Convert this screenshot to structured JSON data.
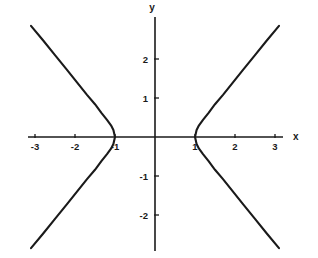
{
  "chart_data": {
    "type": "line",
    "title": "",
    "subtitle": "",
    "xlabel": "x",
    "ylabel": "y",
    "xlim": [
      -3.2,
      3.2
    ],
    "ylim": [
      -3.0,
      3.0
    ],
    "grid": false,
    "legend": null,
    "axis_color": "#1a1a1a",
    "curve_color": "#1a1a1a",
    "background": "#ffffff",
    "x_ticks": [
      {
        "value": -3,
        "label": "-3"
      },
      {
        "value": -2,
        "label": "-2"
      },
      {
        "value": -1,
        "label": "-1"
      },
      {
        "value": 1,
        "label": "1"
      },
      {
        "value": 2,
        "label": "2"
      },
      {
        "value": 3,
        "label": "3"
      }
    ],
    "y_ticks": [
      {
        "value": 2,
        "label": "2"
      },
      {
        "value": 1,
        "label": "1"
      },
      {
        "value": -1,
        "label": "-1"
      },
      {
        "value": -2,
        "label": "-2"
      }
    ],
    "series": [
      {
        "name": "right-branch",
        "description": "Hyperbola right branch, vertex at (1, 0)",
        "points": [
          [
            3.1,
            2.85
          ],
          [
            2.8,
            2.48
          ],
          [
            2.5,
            2.1
          ],
          [
            2.2,
            1.72
          ],
          [
            1.95,
            1.4
          ],
          [
            1.7,
            1.08
          ],
          [
            1.5,
            0.84
          ],
          [
            1.34,
            0.62
          ],
          [
            1.2,
            0.44
          ],
          [
            1.1,
            0.3
          ],
          [
            1.04,
            0.18
          ],
          [
            1.0,
            0.0
          ],
          [
            1.04,
            -0.18
          ],
          [
            1.1,
            -0.3
          ],
          [
            1.2,
            -0.44
          ],
          [
            1.34,
            -0.62
          ],
          [
            1.5,
            -0.84
          ],
          [
            1.7,
            -1.08
          ],
          [
            1.95,
            -1.4
          ],
          [
            2.2,
            -1.72
          ],
          [
            2.5,
            -2.1
          ],
          [
            2.8,
            -2.48
          ],
          [
            3.1,
            -2.85
          ]
        ]
      },
      {
        "name": "left-branch",
        "description": "Hyperbola left branch, vertex at (-1, 0)",
        "points": [
          [
            -3.1,
            2.85
          ],
          [
            -2.8,
            2.48
          ],
          [
            -2.5,
            2.1
          ],
          [
            -2.2,
            1.72
          ],
          [
            -1.95,
            1.4
          ],
          [
            -1.7,
            1.08
          ],
          [
            -1.5,
            0.84
          ],
          [
            -1.34,
            0.62
          ],
          [
            -1.2,
            0.44
          ],
          [
            -1.1,
            0.3
          ],
          [
            -1.04,
            0.18
          ],
          [
            -1.0,
            0.0
          ],
          [
            -1.04,
            -0.18
          ],
          [
            -1.1,
            -0.3
          ],
          [
            -1.2,
            -0.44
          ],
          [
            -1.34,
            -0.62
          ],
          [
            -1.5,
            -0.84
          ],
          [
            -1.7,
            -1.08
          ],
          [
            -1.95,
            -1.4
          ],
          [
            -2.2,
            -1.72
          ],
          [
            -2.5,
            -2.1
          ],
          [
            -2.8,
            -2.48
          ],
          [
            -3.1,
            -2.85
          ]
        ]
      }
    ]
  }
}
